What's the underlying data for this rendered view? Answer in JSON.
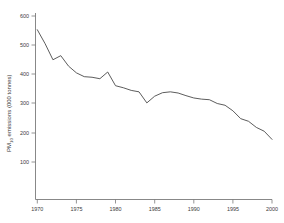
{
  "chart_data": {
    "type": "line",
    "title": "",
    "xlabel": "",
    "ylabel": "PM10 emissions (000 tonnes)",
    "ylabel_main": "PM",
    "ylabel_sub": "10",
    "ylabel_rest": " emissions (000 tonnes)",
    "xlim": [
      1970,
      2000
    ],
    "ylim": [
      0,
      600
    ],
    "grid": false,
    "legend": "none",
    "xticks": [
      1970,
      1975,
      1980,
      1985,
      1990,
      1995,
      2000
    ],
    "yticks": [
      100,
      200,
      300,
      400,
      500,
      600
    ],
    "x": [
      1970,
      1971,
      1972,
      1973,
      1974,
      1975,
      1976,
      1977,
      1978,
      1979,
      1980,
      1981,
      1982,
      1983,
      1984,
      1985,
      1986,
      1987,
      1988,
      1989,
      1990,
      1991,
      1992,
      1993,
      1994,
      1995,
      1996,
      1997,
      1998,
      1999,
      2000
    ],
    "values": [
      553,
      505,
      450,
      464,
      428,
      405,
      392,
      390,
      385,
      408,
      361,
      354,
      345,
      340,
      302,
      325,
      337,
      340,
      336,
      327,
      319,
      315,
      313,
      300,
      294,
      275,
      248,
      239,
      218,
      205,
      177
    ],
    "series": [
      {
        "name": "PM10 emissions",
        "color": "#4a4a4a",
        "values": [
          553,
          505,
          450,
          464,
          428,
          405,
          392,
          390,
          385,
          408,
          361,
          354,
          345,
          340,
          302,
          325,
          337,
          340,
          336,
          327,
          319,
          315,
          313,
          300,
          294,
          275,
          248,
          239,
          218,
          205,
          177
        ]
      }
    ],
    "annotations": []
  },
  "axes": {
    "x_tick_labels": [
      "1970",
      "1975",
      "1980",
      "1985",
      "1990",
      "1995",
      "2000"
    ],
    "y_tick_labels": [
      "100",
      "200",
      "300",
      "400",
      "500",
      "600"
    ]
  }
}
